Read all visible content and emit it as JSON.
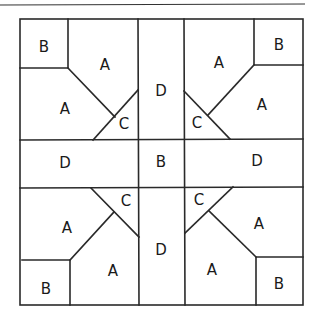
{
  "diagram": {
    "colors": {
      "line": "#2a2a2a",
      "background": "#ffffff",
      "text": "#1a1a1a"
    },
    "pieces": {
      "top_left": {
        "corner": "B",
        "upper": "A",
        "lower": "A",
        "triangle": "C"
      },
      "top_right": {
        "corner": "B",
        "upper": "A",
        "lower": "A",
        "triangle": "C"
      },
      "bottom_left": {
        "corner": "B",
        "upper": "A",
        "lower": "A",
        "triangle": "C"
      },
      "bottom_right": {
        "corner": "B",
        "upper": "A",
        "lower": "A",
        "triangle": "C"
      },
      "top_center": "D",
      "left_center": "D",
      "center": "B",
      "right_center": "D",
      "bottom_center": "D"
    }
  }
}
